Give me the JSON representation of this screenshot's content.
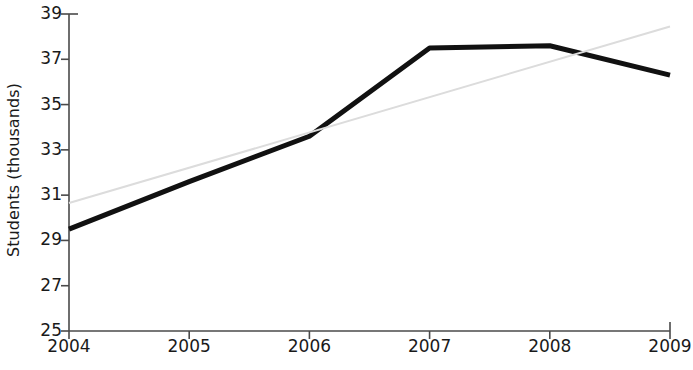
{
  "chart_data": {
    "type": "line",
    "title": "",
    "xlabel": "",
    "ylabel": "Students (thousands)",
    "x": [
      2004,
      2005,
      2006,
      2007,
      2008,
      2009
    ],
    "xticklabels": [
      "2004",
      "2005",
      "2006",
      "2007",
      "2008",
      "2009"
    ],
    "yticks": [
      25,
      27,
      29,
      31,
      33,
      35,
      37,
      39
    ],
    "yticklabels": [
      "25",
      "27",
      "29",
      "31",
      "33",
      "35",
      "37",
      "39"
    ],
    "xlim": [
      2004,
      2009
    ],
    "ylim": [
      25,
      39
    ],
    "grid": false,
    "legend": null,
    "series": [
      {
        "name": "Students",
        "style": "solid",
        "color": "#111111",
        "width": 5,
        "values": [
          29.5,
          31.6,
          33.6,
          37.5,
          37.6,
          36.3
        ]
      },
      {
        "name": "Trend line",
        "style": "solid",
        "color": "#dcdcdc",
        "width": 2,
        "x": [
          2004,
          2009
        ],
        "values": [
          30.65,
          38.45
        ]
      }
    ],
    "axis_color": "#4a4a4a",
    "text_color": "#1a1a1a",
    "background": "#ffffff"
  },
  "geometry": {
    "plot_left": 69,
    "plot_right": 670,
    "plot_top": 14,
    "plot_bottom": 331
  }
}
